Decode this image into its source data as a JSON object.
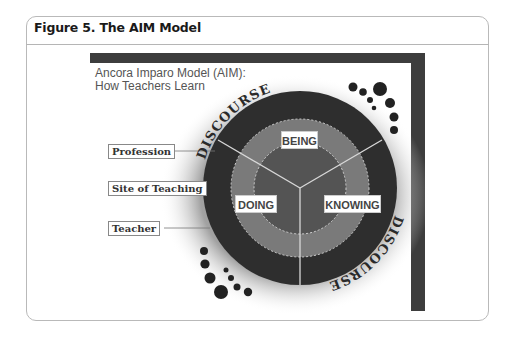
{
  "card": {
    "title": "Figure 5. The AIM Model"
  },
  "figure": {
    "subtitle_line1": "Ancora Imparo Model (AIM):",
    "subtitle_line2": "How Teachers Learn",
    "outer_ring_label_top": "DISCOURSE",
    "outer_ring_label_bottom": "DISCOURSE",
    "ring_segments": {
      "top": "BEING",
      "left": "DOING",
      "right": "KNOWING"
    },
    "side_labels": [
      {
        "label": "Profession",
        "ring": "outer"
      },
      {
        "label": "Site of Teaching",
        "ring": "middle"
      },
      {
        "label": "Teacher",
        "ring": "inner"
      }
    ],
    "colors": {
      "frame": "#3d3d3d",
      "outer_ring": "#2e2e2e",
      "middle_ring": "#7a7a7a",
      "inner_ring": "#545454",
      "dots": "#222222"
    }
  }
}
